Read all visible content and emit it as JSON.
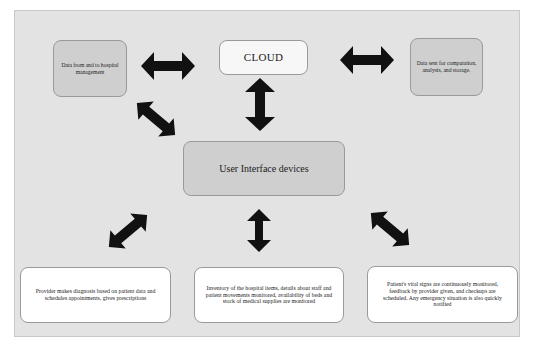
{
  "diagram": {
    "title": "",
    "nodes": {
      "hospital_management": {
        "label": "Data from and to hospital management",
        "fill": "#cfcfcf"
      },
      "cloud": {
        "label": "CLOUD",
        "fill": "#f7f7f7"
      },
      "computation": {
        "label": "Data sent for computation, analysis, and storage.",
        "fill": "#cfcfcf"
      },
      "ui_devices": {
        "label": "User Interface devices",
        "fill": "#cfcfcf"
      },
      "provider": {
        "label": "Provider makes diagnosis based on patient data and schedules appointments, gives prescriptions",
        "fill": "#ffffff"
      },
      "inventory": {
        "label": "Inventory of the hospital items, details about staff and patient movements monitored, availability of beds and stock of medical supplies are monitored",
        "fill": "#ffffff"
      },
      "vitals": {
        "label": "Patient's vital signs are continuously monitored, feedback by provider given, and checkups are scheduled. Any emergency situation is also quickly notified",
        "fill": "#ffffff"
      }
    },
    "edges": [
      {
        "from": "hospital_management",
        "to": "cloud",
        "type": "bidirectional-arrow"
      },
      {
        "from": "cloud",
        "to": "computation",
        "type": "bidirectional-arrow"
      },
      {
        "from": "cloud",
        "to": "ui_devices",
        "type": "bidirectional-arrow"
      },
      {
        "from": "hospital_management",
        "to": "ui_devices",
        "type": "bidirectional-arrow"
      },
      {
        "from": "ui_devices",
        "to": "provider",
        "type": "bidirectional-arrow"
      },
      {
        "from": "ui_devices",
        "to": "inventory",
        "type": "bidirectional-arrow"
      },
      {
        "from": "ui_devices",
        "to": "vitals",
        "type": "bidirectional-arrow"
      }
    ],
    "colors": {
      "background": "#e3e3e3",
      "arrow": "#111111",
      "border": "#9a9a9a"
    }
  }
}
